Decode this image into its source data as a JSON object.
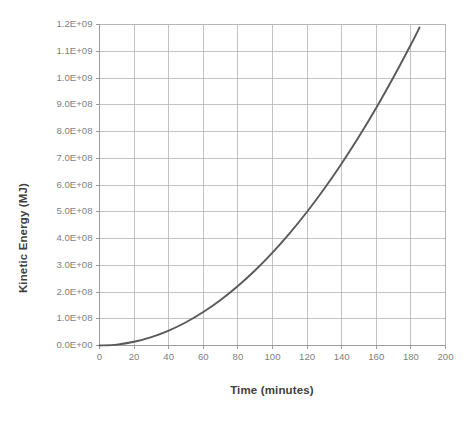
{
  "chart_data": {
    "type": "line",
    "title": "",
    "subtitle": "",
    "xlabel": "Time (minutes)",
    "ylabel": "Kinetic Energy (MJ)",
    "xlim": [
      0,
      200
    ],
    "ylim": [
      0,
      1200000000
    ],
    "grid": true,
    "legend": false,
    "legend_position": "none",
    "x_tick_labels": [
      "0",
      "20",
      "40",
      "60",
      "80",
      "100",
      "120",
      "140",
      "160",
      "180",
      "200"
    ],
    "x_tick_values": [
      0,
      20,
      40,
      60,
      80,
      100,
      120,
      140,
      160,
      180,
      200
    ],
    "y_tick_labels": [
      "0.0E+00",
      "1.0E+08",
      "2.0E+08",
      "3.0E+08",
      "4.0E+08",
      "5.0E+08",
      "6.0E+08",
      "7.0E+08",
      "8.0E+08",
      "9.0E+08",
      "1.0E+09",
      "1.1E+09",
      "1.2E+09"
    ],
    "y_tick_values": [
      0,
      100000000,
      200000000,
      300000000,
      400000000,
      500000000,
      600000000,
      700000000,
      800000000,
      900000000,
      1000000000,
      1100000000,
      1200000000
    ],
    "series": [
      {
        "name": "Kinetic Energy",
        "color": "#595959",
        "x": [
          0,
          10,
          20,
          30,
          40,
          50,
          60,
          70,
          80,
          90,
          100,
          110,
          120,
          130,
          140,
          150,
          160,
          170,
          180,
          185
        ],
        "values": [
          0,
          3472222,
          13888889,
          31250000,
          55555556,
          86805556,
          125000000,
          170138889,
          222222222,
          281250000,
          347222222,
          420138889,
          500000000,
          586805556,
          680555556,
          781250000,
          888888889,
          1003472222,
          1125000000,
          1188715278
        ]
      }
    ]
  },
  "axis": {
    "y_title": "Kinetic Energy (MJ)",
    "x_title": "Time (minutes)"
  },
  "colors": {
    "series": "#595959",
    "gridline": "#b3b3b3",
    "axis": "#9c9c9c",
    "tick_text": "#7f7f7f",
    "title_text": "#404040",
    "background": "#ffffff"
  }
}
